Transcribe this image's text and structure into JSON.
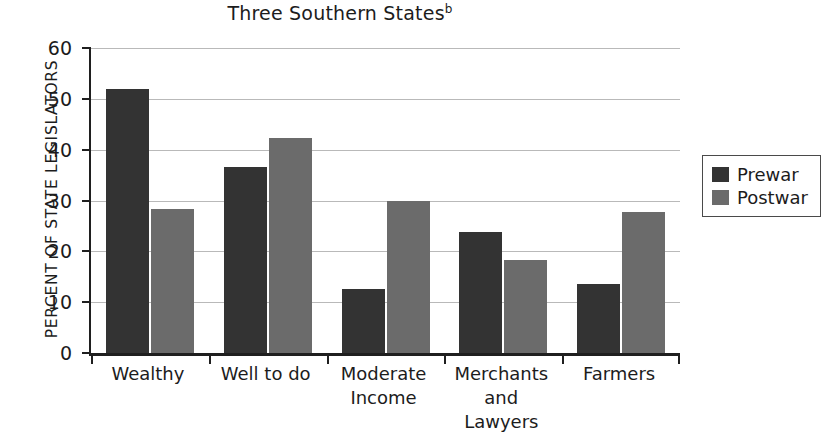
{
  "chart_data": {
    "type": "bar",
    "title": "Three Southern States",
    "title_superscript": "b",
    "xlabel": "",
    "ylabel": "PERCENT OF STATE LEGISLATORS",
    "ylim": [
      0,
      60
    ],
    "yticks": [
      0,
      10,
      20,
      30,
      40,
      50,
      60
    ],
    "ytick_labels": [
      "0",
      "10",
      "20",
      "30",
      "40",
      "50",
      "60"
    ],
    "grid": true,
    "legend_position": "right",
    "categories": [
      "Wealthy",
      "Well to do",
      "Moderate Income",
      "Merchants and Lawyers",
      "Farmers"
    ],
    "category_lines": [
      [
        "Wealthy"
      ],
      [
        "Well to do"
      ],
      [
        "Moderate",
        "Income"
      ],
      [
        "Merchants",
        "and",
        "Lawyers"
      ],
      [
        "Farmers"
      ]
    ],
    "series": [
      {
        "name": "Prewar",
        "color": "#333333",
        "values": [
          52.0,
          36.5,
          12.5,
          23.8,
          13.5
        ]
      },
      {
        "name": "Postwar",
        "color": "#6b6b6b",
        "values": [
          28.3,
          42.3,
          30.0,
          18.2,
          27.7
        ]
      }
    ]
  },
  "legend": {
    "items": [
      {
        "label": "Prewar",
        "swatch": "prewar"
      },
      {
        "label": "Postwar",
        "swatch": "postwar"
      }
    ]
  }
}
